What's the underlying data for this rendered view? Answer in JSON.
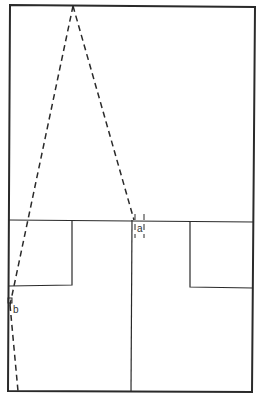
{
  "diagram": {
    "labels": {
      "a": "a",
      "b": "b"
    },
    "stroke_color": "#2a2a2a",
    "background": "#ffffff"
  }
}
